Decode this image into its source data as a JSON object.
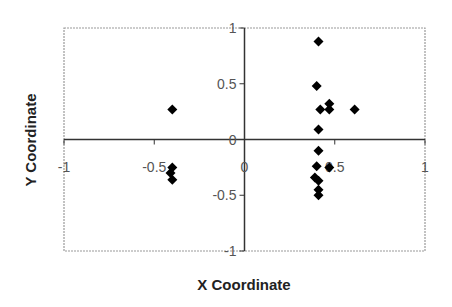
{
  "chart_data": {
    "type": "scatter",
    "title": "",
    "xlabel": "X Coordinate",
    "ylabel": "Y Coordinate",
    "xlim": [
      -1,
      1
    ],
    "ylim": [
      -1,
      1
    ],
    "x_ticks": [
      -1,
      -0.5,
      0,
      0.5,
      1
    ],
    "y_ticks": [
      -1,
      -0.5,
      0,
      0.5,
      1
    ],
    "x_tick_labels": [
      "-1",
      "-0.5",
      "0",
      "0.5",
      "1"
    ],
    "y_tick_labels": [
      "-1",
      "-0.5",
      "0",
      "0.5",
      "1"
    ],
    "grid": false,
    "axes_cross_at_origin": true,
    "legend": null,
    "marker": "diamond",
    "marker_color": "#000000",
    "series": [
      {
        "name": "Points",
        "points": [
          {
            "x": -0.4,
            "y": 0.27
          },
          {
            "x": -0.4,
            "y": -0.25
          },
          {
            "x": -0.41,
            "y": -0.3
          },
          {
            "x": -0.4,
            "y": -0.36
          },
          {
            "x": 0.41,
            "y": 0.88
          },
          {
            "x": 0.4,
            "y": 0.48
          },
          {
            "x": 0.42,
            "y": 0.27
          },
          {
            "x": 0.47,
            "y": 0.32
          },
          {
            "x": 0.47,
            "y": 0.27
          },
          {
            "x": 0.61,
            "y": 0.27
          },
          {
            "x": 0.41,
            "y": 0.09
          },
          {
            "x": 0.41,
            "y": -0.1
          },
          {
            "x": 0.4,
            "y": -0.24
          },
          {
            "x": 0.47,
            "y": -0.25
          },
          {
            "x": 0.39,
            "y": -0.34
          },
          {
            "x": 0.41,
            "y": -0.37
          },
          {
            "x": 0.41,
            "y": -0.45
          },
          {
            "x": 0.41,
            "y": -0.5
          }
        ]
      }
    ]
  },
  "colors": {
    "plot_border": "#999999",
    "axis_line": "#333333",
    "tick_label": "#555555",
    "marker": "#000000"
  }
}
